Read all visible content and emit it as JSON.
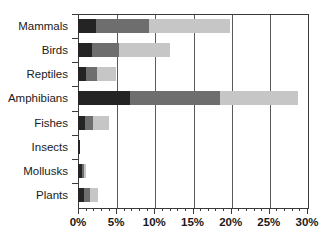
{
  "chart_data": {
    "type": "bar",
    "orientation": "horizontal",
    "stacked": true,
    "title": "",
    "subtitle": "",
    "xlabel": "",
    "ylabel": "",
    "xlim": [
      0,
      30
    ],
    "ylim": null,
    "grid": true,
    "grid_axis": "x",
    "legend": false,
    "legend_position": "none",
    "categories": [
      "Mammals",
      "Birds",
      "Reptiles",
      "Amphibians",
      "Fishes",
      "Insects",
      "Mollusks",
      "Plants"
    ],
    "xtick_labels": [
      "0%",
      "5%",
      "10%",
      "15%",
      "20%",
      "25%",
      "30%"
    ],
    "xtick_values": [
      0,
      5,
      10,
      15,
      20,
      25,
      30
    ],
    "xtick_minor_interval": 1,
    "series": [
      {
        "name": "series-1",
        "color": "#242424",
        "values": [
          2.4,
          1.8,
          1.0,
          6.8,
          0.9,
          0.3,
          0.5,
          0.8
        ]
      },
      {
        "name": "series-2",
        "color": "#6e6e6e",
        "values": [
          6.9,
          3.6,
          1.5,
          11.8,
          1.1,
          0.0,
          0.3,
          0.8
        ]
      },
      {
        "name": "series-3",
        "color": "#c6c6c6",
        "values": [
          10.6,
          6.6,
          2.5,
          10.2,
          2.0,
          0.0,
          0.2,
          1.0
        ]
      }
    ],
    "totals": [
      19.9,
      12.0,
      5.0,
      28.8,
      4.0,
      0.3,
      1.0,
      2.6
    ]
  },
  "colors": {
    "axis": "#3a3a3a",
    "grid": "#5a5a5a",
    "background": "#ffffff",
    "text": "#1a1a1a"
  }
}
